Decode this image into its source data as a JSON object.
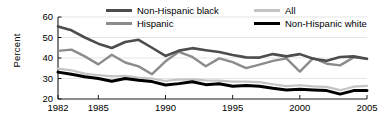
{
  "chart_data": {
    "type": "line",
    "title": "",
    "xlabel": "",
    "ylabel": "Percent",
    "xlim": [
      1982,
      2005
    ],
    "ylim": [
      20,
      60
    ],
    "yticks": [
      20,
      30,
      40,
      50,
      60
    ],
    "xticks": [
      1982,
      1985,
      1990,
      1995,
      2000,
      2005
    ],
    "xtick_labels": [
      "1982",
      "1985",
      "1990",
      "1995",
      "2000",
      "2005"
    ],
    "ytick_labels": [
      "20",
      "30",
      "40",
      "50",
      "60"
    ],
    "grid": "horizontal",
    "legend_position": "top",
    "x": [
      1982,
      1983,
      1984,
      1985,
      1986,
      1987,
      1988,
      1989,
      1990,
      1991,
      1992,
      1993,
      1994,
      1995,
      1996,
      1997,
      1998,
      1999,
      2000,
      2001,
      2002,
      2003,
      2004,
      2005
    ],
    "series": [
      {
        "name": "Non-Hispanic black",
        "color": "#4d4d4d",
        "width": 2.6,
        "values": [
          55.4,
          53.5,
          50.0,
          47.0,
          44.9,
          47.8,
          48.9,
          45.0,
          41.0,
          43.6,
          44.8,
          43.8,
          42.9,
          41.5,
          40.3,
          40.2,
          41.9,
          40.8,
          41.9,
          39.6,
          38.6,
          40.5,
          40.8,
          39.6
        ]
      },
      {
        "name": "Hispanic",
        "color": "#8c8c8c",
        "width": 2.4,
        "values": [
          43.5,
          44.1,
          40.8,
          36.9,
          41.6,
          37.8,
          35.9,
          32.1,
          38.4,
          43.0,
          40.5,
          36.0,
          39.8,
          38.0,
          35.1,
          36.8,
          38.6,
          39.8,
          33.4,
          39.9,
          37.2,
          36.4,
          40.3,
          39.6
        ]
      },
      {
        "name": "All",
        "color": "#c4c4c4",
        "width": 2.2,
        "values": [
          34.8,
          34.0,
          32.4,
          31.6,
          31.0,
          31.3,
          30.4,
          30.0,
          28.8,
          29.5,
          29.6,
          29.1,
          29.0,
          28.5,
          28.5,
          28.2,
          27.2,
          26.3,
          26.7,
          26.2,
          25.9,
          24.3,
          26.0,
          26.4
        ]
      },
      {
        "name": "Non-Hispanic white",
        "color": "#000000",
        "width": 3.0,
        "values": [
          33.1,
          32.1,
          30.9,
          30.0,
          28.7,
          30.0,
          29.1,
          28.5,
          26.8,
          27.5,
          28.4,
          27.0,
          27.4,
          26.2,
          26.6,
          26.2,
          25.2,
          24.4,
          24.7,
          24.4,
          24.1,
          22.4,
          24.1,
          24.1
        ]
      }
    ]
  },
  "legend": {
    "items": [
      {
        "label": "Non-Hispanic black"
      },
      {
        "label": "All"
      },
      {
        "label": "Hispanic"
      },
      {
        "label": "Non-Hispanic white"
      }
    ]
  }
}
